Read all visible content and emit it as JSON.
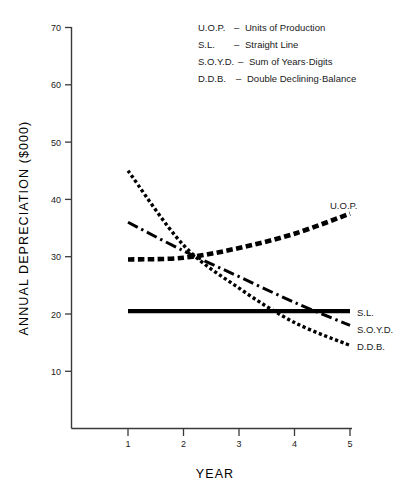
{
  "chart_data": {
    "type": "line",
    "title": "",
    "xlabel": "YEAR",
    "ylabel": "ANNUAL  DEPRECIATION  ($000)",
    "xlim": [
      1,
      5
    ],
    "ylim": [
      0,
      70
    ],
    "x_ticks": [
      "1",
      "2",
      "3",
      "4",
      "5"
    ],
    "y_ticks": [
      "10",
      "20",
      "30",
      "40",
      "50",
      "60",
      "70"
    ],
    "grid": false,
    "legend_position": "top-center",
    "x": [
      1,
      2,
      3,
      4,
      5
    ],
    "series": [
      {
        "name": "U.O.P.",
        "label": "U.O.P.",
        "style": "dashed-bold",
        "values": [
          29.5,
          29.8,
          31.5,
          34.0,
          37.5
        ]
      },
      {
        "name": "S.L.",
        "label": "S.L.",
        "style": "solid-bold",
        "values": [
          20.5,
          20.5,
          20.5,
          20.5,
          20.5
        ]
      },
      {
        "name": "S.O.Y.D.",
        "label": "S.O.Y.D.",
        "style": "dash-dot",
        "values": [
          36.0,
          31.0,
          26.5,
          22.0,
          18.0
        ]
      },
      {
        "name": "D.D.B.",
        "label": "D.D.B.",
        "style": "dotted",
        "values": [
          45.0,
          32.0,
          24.5,
          18.5,
          14.5
        ]
      }
    ],
    "legend_entries": [
      {
        "abbr": "U.O.P.",
        "dash": "–",
        "meaning": "Units of  Production"
      },
      {
        "abbr": "S.L.",
        "dash": "–",
        "meaning": "Straight  Line"
      },
      {
        "abbr": "S.O.Y.D.",
        "dash": "–",
        "meaning": "Sum  of  Years·Digits"
      },
      {
        "abbr": "D.D.B.",
        "dash": "–",
        "meaning": "Double  Declining·Balance"
      }
    ]
  }
}
